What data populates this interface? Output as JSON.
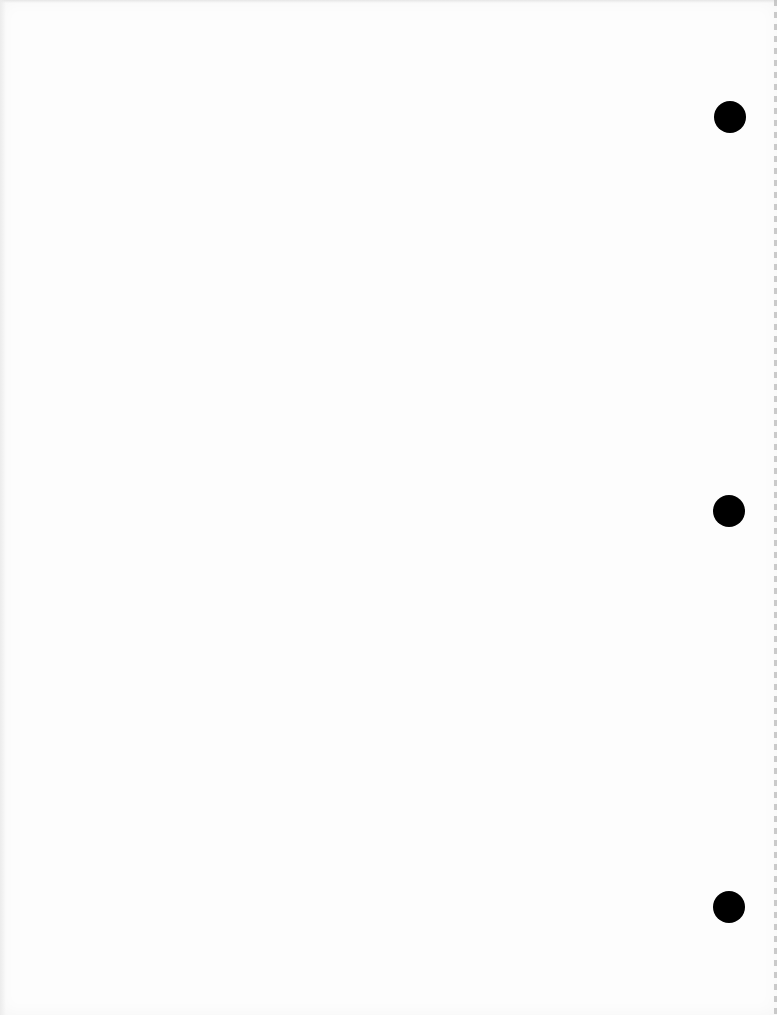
{
  "document": {
    "type": "scanned-blank-page",
    "background_color": "#fdfdfd",
    "text_content": "",
    "punch_holes": [
      {
        "position": "top",
        "color": "#000000"
      },
      {
        "position": "middle",
        "color": "#000000"
      },
      {
        "position": "bottom",
        "color": "#000000"
      }
    ]
  }
}
